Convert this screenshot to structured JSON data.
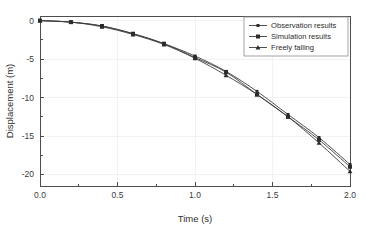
{
  "chart_data": {
    "type": "line",
    "title": "",
    "xlabel": "Time (s)",
    "ylabel": "Displacement (m)",
    "xlim": [
      0.0,
      2.0
    ],
    "ylim": [
      -21.5,
      0.6
    ],
    "xticks": [
      0.0,
      0.5,
      1.0,
      1.5,
      2.0
    ],
    "xticklabels": [
      "0.0",
      "0.5",
      "1.0",
      "1.5",
      "2.0"
    ],
    "yticks": [
      0,
      -5,
      -10,
      -15,
      -20
    ],
    "yticklabels": [
      "0",
      "-5",
      "-10",
      "-15",
      "-20"
    ],
    "x_minor_ticks": [
      0.25,
      0.75,
      1.25,
      1.75
    ],
    "y_minor_ticks": [
      -2.5,
      -7.5,
      -12.5,
      -17.5
    ],
    "grid": true,
    "grid_color": "#f2f2f2",
    "legend_position": "upper right",
    "x": [
      0.0,
      0.2,
      0.4,
      0.6,
      0.8,
      1.0,
      1.2,
      1.4,
      1.6,
      1.8,
      2.0
    ],
    "series": [
      {
        "name": "Observation results",
        "marker": "square-small",
        "color": "#3c3c3c",
        "values": [
          0.0,
          -0.2,
          -0.7,
          -1.7,
          -3.0,
          -4.6,
          -6.6,
          -9.2,
          -12.2,
          -15.2,
          -18.7
        ]
      },
      {
        "name": "Simulation results",
        "marker": "square",
        "color": "#3c3c3c",
        "values": [
          0.0,
          -0.2,
          -0.7,
          -1.7,
          -3.0,
          -4.8,
          -6.7,
          -9.6,
          -12.5,
          -15.5,
          -19.0
        ]
      },
      {
        "name": "Freely falling",
        "marker": "triangle",
        "color": "#3c3c3c",
        "values": [
          0.0,
          -0.2,
          -0.8,
          -1.8,
          -3.1,
          -4.9,
          -7.1,
          -9.6,
          -12.5,
          -15.9,
          -19.6
        ]
      }
    ]
  },
  "legend": {
    "entries": [
      {
        "label": "Observation results"
      },
      {
        "label": "Simulation results"
      },
      {
        "label": "Freely falling"
      }
    ]
  },
  "axes": {
    "x_title": "Time (s)",
    "y_title": "Displacement (m)"
  }
}
